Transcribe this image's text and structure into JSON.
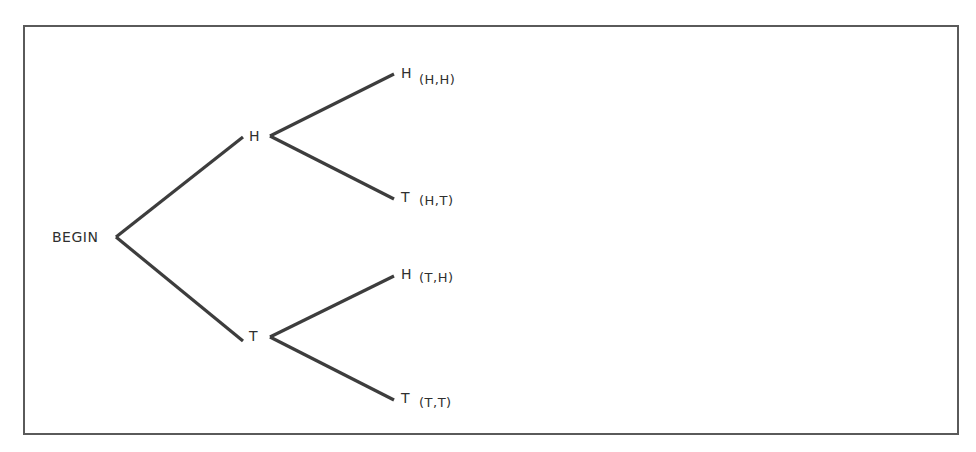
{
  "diagram": {
    "type": "probability-tree",
    "root": {
      "label": "BEGIN"
    },
    "level1": [
      {
        "label": "H"
      },
      {
        "label": "T"
      }
    ],
    "leaves": [
      {
        "label": "H",
        "outcome": "(H,H)",
        "parent": "H"
      },
      {
        "label": "T",
        "outcome": "(H,T)",
        "parent": "H"
      },
      {
        "label": "H",
        "outcome": "(T,H)",
        "parent": "T"
      },
      {
        "label": "T",
        "outcome": "(T,T)",
        "parent": "T"
      }
    ],
    "colors": {
      "line": "#3d3d3d",
      "text": "#2f2f2f",
      "border": "#5a5a5a",
      "background": "#ffffff"
    }
  }
}
